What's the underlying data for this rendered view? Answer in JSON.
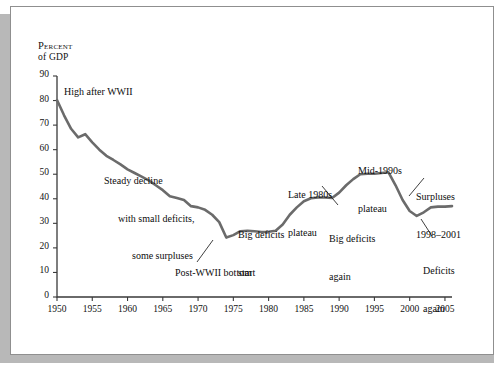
{
  "figure": {
    "y_axis_title_line1": "Percent",
    "y_axis_title_line2": "of GDP"
  },
  "chart_data": {
    "type": "line",
    "title": "",
    "xlabel": "",
    "ylabel": "Percent of GDP",
    "xlim": [
      1950,
      2006
    ],
    "ylim": [
      0,
      90
    ],
    "grid": false,
    "legend": "none",
    "line_color": "#6b6b6b",
    "axis_color": "#3a3a3a",
    "yticks": [
      0,
      10,
      20,
      30,
      40,
      50,
      60,
      70,
      80,
      90
    ],
    "xticks": [
      1950,
      1955,
      1960,
      1965,
      1970,
      1975,
      1980,
      1985,
      1990,
      1995,
      2000,
      2005
    ],
    "x": [
      1950,
      1951,
      1952,
      1953,
      1954,
      1955,
      1956,
      1957,
      1958,
      1959,
      1960,
      1961,
      1962,
      1963,
      1964,
      1965,
      1966,
      1967,
      1968,
      1969,
      1970,
      1971,
      1972,
      1973,
      1974,
      1975,
      1976,
      1977,
      1978,
      1979,
      1980,
      1981,
      1982,
      1983,
      1984,
      1985,
      1986,
      1987,
      1988,
      1989,
      1990,
      1991,
      1992,
      1993,
      1994,
      1995,
      1996,
      1997,
      1998,
      1999,
      2000,
      2001,
      2002,
      2003,
      2004,
      2005,
      2006
    ],
    "values": [
      80.2,
      74.0,
      68.5,
      65.0,
      66.3,
      63.0,
      60.0,
      57.5,
      55.8,
      54.0,
      52.0,
      50.5,
      49.0,
      47.5,
      45.5,
      43.5,
      41.0,
      40.3,
      39.5,
      37.0,
      36.5,
      35.5,
      33.5,
      30.5,
      24.2,
      25.2,
      26.8,
      27.0,
      26.8,
      26.5,
      26.6,
      27.0,
      29.5,
      33.5,
      36.5,
      39.0,
      40.2,
      40.5,
      40.5,
      40.3,
      42.5,
      45.5,
      48.0,
      50.0,
      50.2,
      50.2,
      50.5,
      50.8,
      45.5,
      39.5,
      35.0,
      33.0,
      34.5,
      36.5,
      36.8,
      36.8,
      37.0
    ],
    "annotations": [
      {
        "text": "High after WWII",
        "x": 1950.6,
        "y": 81,
        "leader": false
      },
      {
        "text": "Steady decline\nwith small deficits,\nsome surpluses",
        "x": 1956,
        "y": 58,
        "leader": false
      },
      {
        "text": "Post-WWII bottom",
        "x": 1971,
        "y": 13,
        "leader": true
      },
      {
        "text": "Big deficits\nstart",
        "x": 1980.5,
        "y": 32,
        "leader": false
      },
      {
        "text": "Late 1980s\nplateau",
        "x": 1986.5,
        "y": 53,
        "leader": false
      },
      {
        "text": "Big deficits\nagain",
        "x": 1990.5,
        "y": 31,
        "leader": true
      },
      {
        "text": "Mid-1990s\nplateau",
        "x": 1993.5,
        "y": 63,
        "leader": false
      },
      {
        "text": "Surpluses\n1998–2001",
        "x": 2000,
        "y": 53,
        "leader": true
      },
      {
        "text": "Deficits\nagain",
        "x": 2001.5,
        "y": 22,
        "leader": true
      }
    ]
  },
  "annotations": {
    "high_after_wwii": "High after WWII",
    "steady_decline_1": "Steady decline",
    "steady_decline_2": "with small deficits,",
    "steady_decline_3": "some surpluses",
    "post_wwii_bottom": "Post-WWII bottom",
    "big_deficits_start_1": "Big deficits",
    "big_deficits_start_2": "start",
    "late_1980s_1": "Late 1980s",
    "late_1980s_2": "plateau",
    "big_deficits_again_1": "Big deficits",
    "big_deficits_again_2": "again",
    "mid_1990s_1": "Mid-1990s",
    "mid_1990s_2": "plateau",
    "surpluses_1": "Surpluses",
    "surpluses_2": "1998–2001",
    "deficits_again_1": "Deficits",
    "deficits_again_2": "again"
  }
}
